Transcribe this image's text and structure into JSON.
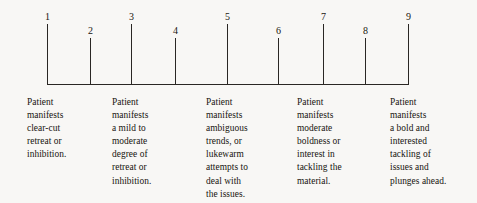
{
  "figure": {
    "name": "nine-point-bipolar-rating-scale",
    "background_color": "#f8f7f5",
    "ink_color": "#2a2724"
  },
  "scale": {
    "baseline": {
      "x_start": 47,
      "x_end": 408,
      "y": 84
    },
    "ticks": [
      {
        "label": "1",
        "x": 47,
        "height": 60,
        "top": 24,
        "label_y": 12
      },
      {
        "label": "2",
        "x": 90,
        "height": 46,
        "top": 38,
        "label_y": 26
      },
      {
        "label": "3",
        "x": 131,
        "height": 60,
        "top": 24,
        "label_y": 12
      },
      {
        "label": "4",
        "x": 175,
        "height": 46,
        "top": 38,
        "label_y": 26
      },
      {
        "label": "5",
        "x": 227,
        "height": 60,
        "top": 24,
        "label_y": 12
      },
      {
        "label": "6",
        "x": 278,
        "height": 46,
        "top": 38,
        "label_y": 26
      },
      {
        "label": "7",
        "x": 323,
        "height": 60,
        "top": 24,
        "label_y": 12
      },
      {
        "label": "8",
        "x": 365,
        "height": 46,
        "top": 38,
        "label_y": 26
      },
      {
        "label": "9",
        "x": 408,
        "height": 60,
        "top": 24,
        "label_y": 12
      }
    ]
  },
  "descriptors": [
    {
      "anchor_point": "1",
      "x": 27,
      "lines": [
        "Patient",
        "manifests",
        "clear-cut",
        "retreat or",
        "inhibition."
      ]
    },
    {
      "anchor_point": "3",
      "x": 112,
      "lines": [
        "Patient",
        "manifests",
        "a mild to",
        "moderate",
        "degree of",
        "retreat or",
        "inhibition."
      ]
    },
    {
      "anchor_point": "5",
      "x": 206,
      "lines": [
        "Patient",
        "manifests",
        "ambiguous",
        "trends, or",
        "lukewarm",
        "attempts to",
        "deal with",
        "the issues."
      ]
    },
    {
      "anchor_point": "7",
      "x": 297,
      "lines": [
        "Patient",
        "manifests",
        "moderate",
        "boldness or",
        "interest in",
        "tackling the",
        "material."
      ]
    },
    {
      "anchor_point": "9",
      "x": 390,
      "lines": [
        "Patient",
        "manifests",
        "a bold and",
        "interested",
        "tackling of",
        "issues and",
        "plunges ahead."
      ]
    }
  ]
}
